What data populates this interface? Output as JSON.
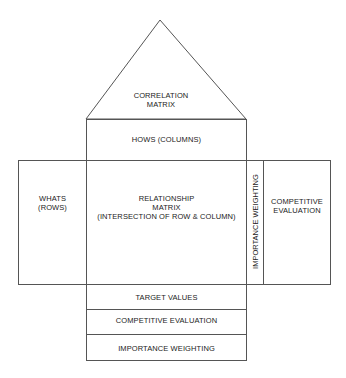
{
  "diagram": {
    "roof": {
      "label": "CORRELATION\nMATRIX"
    },
    "hows": {
      "label": "HOWS (COLUMNS)"
    },
    "whats": {
      "label": "WHATS\n(ROWS)"
    },
    "relationship": {
      "label": "RELATIONSHIP\nMATRIX\n(INTERSECTION OF ROW & COLUMN)"
    },
    "importance_side": {
      "label": "IMPORTANCE WEIGHTING"
    },
    "competitive_side": {
      "label": "COMPETITIVE\nEVALUATION"
    },
    "bottom_rows": [
      {
        "label": "TARGET VALUES"
      },
      {
        "label": "COMPETITIVE EVALUATION"
      },
      {
        "label": "IMPORTANCE WEIGHTING"
      }
    ],
    "line_color": "#555555"
  }
}
